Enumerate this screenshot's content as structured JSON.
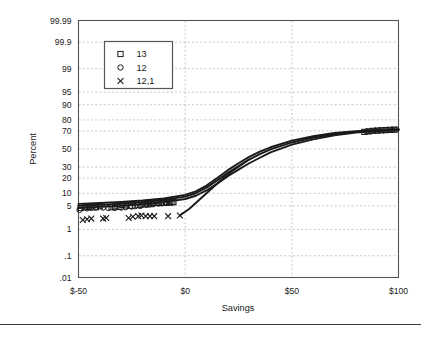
{
  "chart_data": {
    "type": "scatter",
    "title": "",
    "subtitle": "",
    "xlabel": "Savings",
    "ylabel": "Percent",
    "grid": true,
    "grid_style": "dashed",
    "legend_position": "top-left-inside",
    "xlim": [
      -50,
      100
    ],
    "xticks": [
      -50,
      0,
      50,
      100
    ],
    "xticklabels": [
      "$-50",
      "$0",
      "$50",
      "$100"
    ],
    "yscale": "normal-probability",
    "ylim": [
      0.01,
      99.99
    ],
    "yticks": [
      99.99,
      99.9,
      99,
      95,
      90,
      80,
      70,
      50,
      30,
      20,
      10,
      5,
      1,
      0.1,
      0.01
    ],
    "yticklabels": [
      "99.99",
      "99.9",
      "99",
      "95",
      "90",
      "80",
      "70",
      "50",
      "30",
      "20",
      "10",
      "5",
      "1",
      ".1",
      ".01"
    ],
    "series": [
      {
        "name": "13",
        "marker": "square",
        "color": "#1a1a1a",
        "points": [
          {
            "x": -49.0,
            "y": 4.4
          },
          {
            "x": -47.0,
            "y": 4.6
          },
          {
            "x": -45.2,
            "y": 4.7
          },
          {
            "x": -43.5,
            "y": 4.8
          },
          {
            "x": -41.8,
            "y": 4.6
          },
          {
            "x": -40.0,
            "y": 4.9
          },
          {
            "x": -34.5,
            "y": 4.6
          },
          {
            "x": -32.8,
            "y": 4.8
          },
          {
            "x": -31.2,
            "y": 4.7
          },
          {
            "x": -29.5,
            "y": 5.3
          },
          {
            "x": -27.8,
            "y": 5.1
          },
          {
            "x": -26.0,
            "y": 5.0
          },
          {
            "x": -22.0,
            "y": 5.2
          },
          {
            "x": -20.5,
            "y": 5.4
          },
          {
            "x": -19.0,
            "y": 5.5
          },
          {
            "x": -17.5,
            "y": 5.7
          },
          {
            "x": -16.0,
            "y": 5.8
          },
          {
            "x": -14.5,
            "y": 5.9
          },
          {
            "x": -13.0,
            "y": 6.0
          },
          {
            "x": -11.5,
            "y": 6.0
          },
          {
            "x": -10.0,
            "y": 6.1
          },
          {
            "x": -8.5,
            "y": 6.1
          },
          {
            "x": -7.0,
            "y": 6.2
          },
          {
            "x": -5.5,
            "y": 6.2
          },
          {
            "x": 84.0,
            "y": 69.0
          },
          {
            "x": 86.0,
            "y": 69.5
          },
          {
            "x": 88.0,
            "y": 70.0
          },
          {
            "x": 90.0,
            "y": 70.3
          },
          {
            "x": 92.0,
            "y": 70.6
          },
          {
            "x": 94.0,
            "y": 70.8
          },
          {
            "x": 96.0,
            "y": 71.0
          },
          {
            "x": 98.0,
            "y": 71.2
          }
        ]
      },
      {
        "name": "12",
        "marker": "circle",
        "color": "#1a1a1a",
        "points": [
          {
            "x": -49.5,
            "y": 3.9
          },
          {
            "x": -46.0,
            "y": 4.3
          },
          {
            "x": -44.0,
            "y": 4.4
          },
          {
            "x": -42.0,
            "y": 4.5
          },
          {
            "x": -38.5,
            "y": 4.5
          },
          {
            "x": -36.0,
            "y": 4.4
          },
          {
            "x": -33.0,
            "y": 4.4
          },
          {
            "x": -30.0,
            "y": 4.5
          },
          {
            "x": -28.0,
            "y": 4.6
          },
          {
            "x": -25.0,
            "y": 4.8
          },
          {
            "x": -23.5,
            "y": 4.9
          },
          {
            "x": -21.0,
            "y": 5.0
          },
          {
            "x": -18.0,
            "y": 5.3
          },
          {
            "x": -16.5,
            "y": 5.4
          },
          {
            "x": -15.0,
            "y": 5.5
          },
          {
            "x": -12.5,
            "y": 5.7
          },
          {
            "x": -11.0,
            "y": 5.8
          },
          {
            "x": -9.0,
            "y": 5.9
          },
          {
            "x": -7.5,
            "y": 6.0
          },
          {
            "x": -6.0,
            "y": 6.0
          },
          {
            "x": 85.0,
            "y": 69.2
          },
          {
            "x": 87.0,
            "y": 69.8
          },
          {
            "x": 89.0,
            "y": 70.1
          },
          {
            "x": 91.0,
            "y": 70.4
          },
          {
            "x": 93.0,
            "y": 70.7
          },
          {
            "x": 95.0,
            "y": 70.9
          },
          {
            "x": 97.0,
            "y": 71.1
          },
          {
            "x": 99.0,
            "y": 71.3
          }
        ]
      },
      {
        "name": "12,1",
        "marker": "cross",
        "color": "#1a1a1a",
        "points": [
          {
            "x": -48.0,
            "y": 2.0
          },
          {
            "x": -46.0,
            "y": 2.1
          },
          {
            "x": -44.0,
            "y": 2.2
          },
          {
            "x": -38.5,
            "y": 2.2
          },
          {
            "x": -37.0,
            "y": 2.3
          },
          {
            "x": -26.5,
            "y": 2.3
          },
          {
            "x": -24.5,
            "y": 2.5
          },
          {
            "x": -22.0,
            "y": 2.6
          },
          {
            "x": -20.5,
            "y": 2.7
          },
          {
            "x": -18.5,
            "y": 2.6
          },
          {
            "x": -16.5,
            "y": 2.6
          },
          {
            "x": -14.5,
            "y": 2.6
          },
          {
            "x": -8.0,
            "y": 2.6
          },
          {
            "x": -2.5,
            "y": 2.7
          }
        ]
      }
    ],
    "fit_lines": [
      {
        "name": "fit-upper",
        "points": [
          {
            "x": -50,
            "y": 5.6
          },
          {
            "x": -40,
            "y": 5.9
          },
          {
            "x": -30,
            "y": 6.3
          },
          {
            "x": -20,
            "y": 6.8
          },
          {
            "x": -10,
            "y": 7.6
          },
          {
            "x": 0,
            "y": 9.2
          },
          {
            "x": 5,
            "y": 11.0
          },
          {
            "x": 10,
            "y": 14.5
          },
          {
            "x": 15,
            "y": 20.0
          },
          {
            "x": 20,
            "y": 27.0
          },
          {
            "x": 25,
            "y": 34.0
          },
          {
            "x": 30,
            "y": 41.0
          },
          {
            "x": 35,
            "y": 47.0
          },
          {
            "x": 40,
            "y": 52.0
          },
          {
            "x": 50,
            "y": 59.5
          },
          {
            "x": 60,
            "y": 64.5
          },
          {
            "x": 70,
            "y": 67.8
          },
          {
            "x": 80,
            "y": 69.8
          },
          {
            "x": 90,
            "y": 70.9
          },
          {
            "x": 100,
            "y": 71.6
          }
        ]
      },
      {
        "name": "fit-middle",
        "points": [
          {
            "x": -50,
            "y": 5.0
          },
          {
            "x": -40,
            "y": 5.3
          },
          {
            "x": -30,
            "y": 5.7
          },
          {
            "x": -20,
            "y": 6.2
          },
          {
            "x": -10,
            "y": 7.0
          },
          {
            "x": 0,
            "y": 8.4
          },
          {
            "x": 5,
            "y": 10.0
          },
          {
            "x": 10,
            "y": 13.2
          },
          {
            "x": 15,
            "y": 18.2
          },
          {
            "x": 20,
            "y": 24.5
          },
          {
            "x": 25,
            "y": 31.0
          },
          {
            "x": 30,
            "y": 38.0
          },
          {
            "x": 35,
            "y": 44.0
          },
          {
            "x": 40,
            "y": 49.5
          },
          {
            "x": 50,
            "y": 57.5
          },
          {
            "x": 60,
            "y": 63.0
          },
          {
            "x": 70,
            "y": 66.8
          },
          {
            "x": 80,
            "y": 69.0
          },
          {
            "x": 90,
            "y": 70.4
          },
          {
            "x": 100,
            "y": 71.2
          }
        ]
      },
      {
        "name": "fit-lower",
        "points": [
          {
            "x": -50,
            "y": 4.4
          },
          {
            "x": -40,
            "y": 4.7
          },
          {
            "x": -30,
            "y": 5.0
          },
          {
            "x": -20,
            "y": 5.5
          },
          {
            "x": -10,
            "y": 6.2
          },
          {
            "x": 0,
            "y": 7.4
          },
          {
            "x": 5,
            "y": 8.8
          },
          {
            "x": 10,
            "y": 11.5
          },
          {
            "x": 15,
            "y": 15.8
          },
          {
            "x": 20,
            "y": 21.5
          },
          {
            "x": 25,
            "y": 27.5
          },
          {
            "x": 30,
            "y": 34.0
          },
          {
            "x": 35,
            "y": 40.0
          },
          {
            "x": 40,
            "y": 46.0
          },
          {
            "x": 50,
            "y": 55.0
          },
          {
            "x": 60,
            "y": 61.0
          },
          {
            "x": 70,
            "y": 65.5
          },
          {
            "x": 80,
            "y": 68.2
          },
          {
            "x": 90,
            "y": 69.9
          },
          {
            "x": 100,
            "y": 70.9
          }
        ]
      },
      {
        "name": "fit-cross-tail",
        "points": [
          {
            "x": -2.5,
            "y": 2.7
          },
          {
            "x": 2,
            "y": 4.2
          },
          {
            "x": 6,
            "y": 6.6
          },
          {
            "x": 10,
            "y": 10.0
          },
          {
            "x": 14,
            "y": 14.5
          },
          {
            "x": 18,
            "y": 20.0
          },
          {
            "x": 22,
            "y": 26.0
          },
          {
            "x": 26,
            "y": 32.0
          },
          {
            "x": 30,
            "y": 38.0
          }
        ]
      }
    ],
    "legend": [
      {
        "label": "13",
        "marker": "square"
      },
      {
        "label": "12",
        "marker": "circle"
      },
      {
        "label": "12,1",
        "marker": "cross"
      }
    ]
  },
  "colors": {
    "frame": "#555555",
    "grid": "#bfbfbf",
    "data": "#1a1a1a",
    "legend_border": "#555555",
    "rule": "#3b3b3b"
  }
}
